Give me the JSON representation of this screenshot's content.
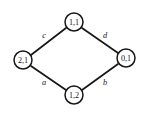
{
  "diagram": {
    "type": "graph",
    "shape": "diamond",
    "background_color": "#ffffff",
    "stroke_color": "#171717",
    "node_fill_color": "#ffffff",
    "nodes": [
      {
        "id": "top",
        "label": "1,1",
        "cx": 74,
        "cy": 22,
        "r": 9
      },
      {
        "id": "left",
        "label": "2,1",
        "cx": 23,
        "cy": 60,
        "r": 9
      },
      {
        "id": "right",
        "label": "0,1",
        "cx": 126,
        "cy": 58,
        "r": 9
      },
      {
        "id": "bottom",
        "label": "1,2",
        "cx": 74,
        "cy": 95,
        "r": 9
      }
    ],
    "edges": [
      {
        "id": "edge-c",
        "label": "c",
        "from": "left",
        "to": "top",
        "x1": 31,
        "y1": 55,
        "x2": 66,
        "y2": 28,
        "lx": 44,
        "ly": 35
      },
      {
        "id": "edge-d",
        "label": "d",
        "from": "top",
        "to": "right",
        "x1": 82,
        "y1": 28,
        "x2": 118,
        "y2": 53,
        "lx": 105,
        "ly": 35
      },
      {
        "id": "edge-a",
        "label": "a",
        "from": "left",
        "to": "bottom",
        "x1": 31,
        "y1": 66,
        "x2": 66,
        "y2": 90,
        "lx": 44,
        "ly": 82
      },
      {
        "id": "edge-b",
        "label": "b",
        "from": "bottom",
        "to": "right",
        "x1": 82,
        "y1": 90,
        "x2": 118,
        "y2": 64,
        "lx": 105,
        "ly": 82
      }
    ]
  }
}
